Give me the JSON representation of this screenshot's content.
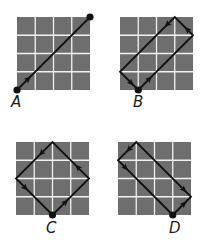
{
  "figure": {
    "grid_fill": "#6e6e6e",
    "grid_line": "#f2f2f2",
    "path_color": "#111111",
    "cells": 4,
    "panels": [
      {
        "label": "A",
        "origin": [
          17,
          17
        ],
        "size": 73,
        "dot": [
          0,
          4
        ],
        "path": [
          [
            0,
            4
          ],
          [
            4,
            0
          ]
        ],
        "extra_dot": [
          4,
          0
        ],
        "arrows": [
          {
            "at": [
              0.6,
              3.4
            ],
            "dir": [
              1,
              -1
            ]
          }
        ]
      },
      {
        "label": "B",
        "origin": [
          120,
          17
        ],
        "size": 73,
        "dot": [
          1,
          4
        ],
        "path": [
          [
            1,
            4
          ],
          [
            4,
            1
          ],
          [
            3,
            0
          ],
          [
            0,
            3
          ],
          [
            1,
            4
          ]
        ],
        "arrows": [
          {
            "at": [
              1.6,
              3.4
            ],
            "dir": [
              1,
              -1
            ]
          },
          {
            "at": [
              3.7,
              0.7
            ],
            "dir": [
              -1,
              -1
            ]
          },
          {
            "at": [
              2.6,
              0.4
            ],
            "dir": [
              -1,
              1
            ]
          },
          {
            "at": [
              0.6,
              3.6
            ],
            "dir": [
              1,
              1
            ]
          }
        ]
      },
      {
        "label": "C",
        "origin": [
          16,
          142
        ],
        "size": 73,
        "dot": [
          2,
          4
        ],
        "path": [
          [
            2,
            4
          ],
          [
            4,
            2
          ],
          [
            2,
            0
          ],
          [
            0,
            2
          ],
          [
            2,
            4
          ]
        ],
        "arrows": [
          {
            "at": [
              2.7,
              3.3
            ],
            "dir": [
              1,
              -1
            ]
          },
          {
            "at": [
              3.4,
              1.4
            ],
            "dir": [
              -1,
              -1
            ]
          },
          {
            "at": [
              1.4,
              0.6
            ],
            "dir": [
              -1,
              1
            ]
          },
          {
            "at": [
              0.5,
              2.5
            ],
            "dir": [
              1,
              1
            ]
          }
        ]
      },
      {
        "label": "D",
        "origin": [
          118,
          142
        ],
        "size": 73,
        "dot": [
          3,
          4
        ],
        "path": [
          [
            3,
            4
          ],
          [
            4,
            3
          ],
          [
            1,
            0
          ],
          [
            0,
            1
          ],
          [
            3,
            4
          ]
        ],
        "arrows": [
          {
            "at": [
              3.6,
              3.4
            ],
            "dir": [
              1,
              -1
            ]
          },
          {
            "at": [
              3.6,
              2.6
            ],
            "dir": [
              1,
              1
            ]
          },
          {
            "at": [
              0.6,
              0.4
            ],
            "dir": [
              -1,
              1
            ]
          },
          {
            "at": [
              0.4,
              1.4
            ],
            "dir": [
              1,
              1
            ]
          }
        ]
      }
    ]
  }
}
